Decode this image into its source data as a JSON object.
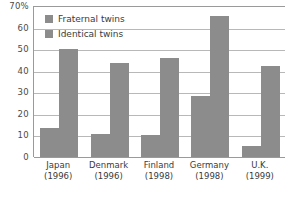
{
  "chart_data": {
    "type": "bar",
    "title": "",
    "subtitle": "",
    "xlabel": "",
    "ylabel": "",
    "ylim": [
      0,
      70
    ],
    "yticks": [
      0,
      10,
      20,
      30,
      40,
      50,
      60,
      70
    ],
    "ytick_labels": [
      "0",
      "10",
      "20",
      "30",
      "40",
      "50",
      "60",
      "70%"
    ],
    "grid": true,
    "legend_position": "top-left",
    "categories": [
      "Japan",
      "Denmark",
      "Finland",
      "Germany",
      "U.K."
    ],
    "category_years": [
      "(1996)",
      "(1996)",
      "(1998)",
      "(1998)",
      "(1999)"
    ],
    "series": [
      {
        "name": "Fraternal twins",
        "color": "#8c8c8c",
        "values": [
          13.5,
          10.5,
          10,
          28.5,
          5
        ]
      },
      {
        "name": "Identical twins",
        "color": "#8c8c8c",
        "values": [
          50,
          43.5,
          46,
          65.5,
          42
        ]
      }
    ]
  },
  "legend": {
    "items": [
      {
        "label": "Fraternal twins"
      },
      {
        "label": "Identical twins"
      }
    ]
  },
  "colors": {
    "bar": "#8c8c8c",
    "gridline": "#b8b8b8",
    "axis": "#9a9a9a",
    "text": "#3a3a3a",
    "background": "#ffffff"
  }
}
